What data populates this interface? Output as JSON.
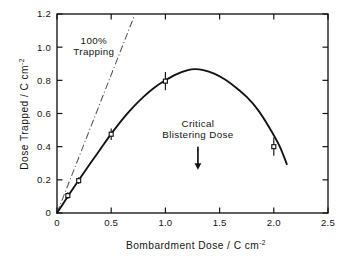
{
  "chart_data": {
    "type": "line",
    "title": "",
    "xlabel": "Bombardment Dose / C cm",
    "xlabel_exponent": "-2",
    "ylabel": "Dose Trapped / C cm",
    "ylabel_exponent": "-2",
    "xlim": [
      0,
      2.5
    ],
    "ylim": [
      0,
      1.2
    ],
    "xticks": [
      0,
      0.5,
      1.0,
      1.5,
      2.0,
      2.5
    ],
    "xticklabels": [
      "0",
      "0.5",
      "1.0",
      "1.5",
      "2.0",
      "2.5"
    ],
    "yticks": [
      0,
      0.2,
      0.4,
      0.6,
      0.8,
      1.0,
      1.2
    ],
    "yticklabels": [
      "0",
      "0.2",
      "0.4",
      "0.6",
      "0.8",
      "1.0",
      "1.2"
    ],
    "grid": false,
    "legend": "none",
    "series": [
      {
        "name": "Dose trapped",
        "style": "solid-curve-with-points",
        "points": [
          {
            "x": 0.1,
            "y": 0.105,
            "yerr": 0.02
          },
          {
            "x": 0.2,
            "y": 0.195,
            "yerr": 0.02
          },
          {
            "x": 0.5,
            "y": 0.475,
            "yerr": 0.035
          },
          {
            "x": 1.0,
            "y": 0.795,
            "yerr": 0.055
          },
          {
            "x": 2.0,
            "y": 0.4,
            "yerr": 0.055
          }
        ],
        "curve": [
          {
            "x": 0.0,
            "y": 0.0
          },
          {
            "x": 0.1,
            "y": 0.1
          },
          {
            "x": 0.2,
            "y": 0.197
          },
          {
            "x": 0.3,
            "y": 0.292
          },
          {
            "x": 0.4,
            "y": 0.385
          },
          {
            "x": 0.5,
            "y": 0.477
          },
          {
            "x": 0.6,
            "y": 0.562
          },
          {
            "x": 0.7,
            "y": 0.637
          },
          {
            "x": 0.8,
            "y": 0.702
          },
          {
            "x": 0.9,
            "y": 0.757
          },
          {
            "x": 1.0,
            "y": 0.8
          },
          {
            "x": 1.1,
            "y": 0.836
          },
          {
            "x": 1.2,
            "y": 0.86
          },
          {
            "x": 1.27,
            "y": 0.868
          },
          {
            "x": 1.35,
            "y": 0.862
          },
          {
            "x": 1.45,
            "y": 0.84
          },
          {
            "x": 1.55,
            "y": 0.805
          },
          {
            "x": 1.65,
            "y": 0.757
          },
          {
            "x": 1.75,
            "y": 0.7
          },
          {
            "x": 1.85,
            "y": 0.625
          },
          {
            "x": 1.95,
            "y": 0.525
          },
          {
            "x": 2.05,
            "y": 0.408
          },
          {
            "x": 2.12,
            "y": 0.295
          }
        ]
      },
      {
        "name": "100% Trapping",
        "style": "dash-dot-line",
        "x_from": 0.0,
        "y_from": 0.0,
        "x_to": 0.72,
        "y_to": 1.2,
        "slope": 1.0
      }
    ],
    "annotations": [
      {
        "name": "trapping-label",
        "line1": "100%",
        "line2": "Trapping",
        "x": 0.34,
        "y": 1.02
      },
      {
        "name": "critical-blistering-label",
        "line1": "Critical",
        "line2": "Blistering  Dose",
        "x": 1.3,
        "y": 0.52,
        "arrow_x": 1.3,
        "arrow_y_from": 0.4,
        "arrow_y_to": 0.27
      }
    ],
    "colors": {
      "axis": "#141414",
      "curve": "#121212",
      "refline": "#555555",
      "marker_fill": "#ffffff",
      "background": "#ffffff"
    }
  }
}
